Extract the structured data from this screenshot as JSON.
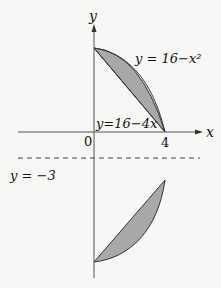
{
  "diagram": {
    "axes": {
      "x_label": "x",
      "y_label": "y",
      "origin_label": "0",
      "x_tick_label": "4"
    },
    "curves": {
      "parabola_label": "y = 16−x²",
      "line_label": "y=16−4x",
      "axis_line_label": "y = −3"
    },
    "colors": {
      "fill": "#a8a8a8",
      "stroke": "#333333",
      "background": "#f7f7f5"
    }
  }
}
